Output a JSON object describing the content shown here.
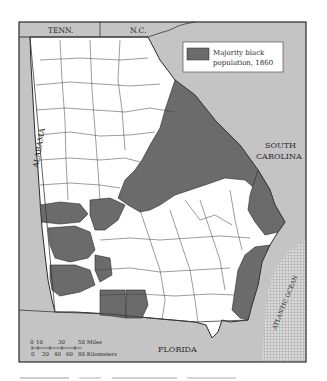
{
  "map": {
    "title_states": {
      "north_left": "TENN.",
      "north_right": "N.C.",
      "east": [
        "SOUTH",
        "CAROLINA"
      ],
      "west": "ALABAMA",
      "south": "FLORIDA",
      "ocean": "ATLANTIC OCEAN"
    },
    "legend": {
      "swatch_color": "#6b6b6b",
      "label_line1": "Majority black",
      "label_line2": "population, 1860"
    },
    "scale_bar": {
      "miles_ticks": [
        "0",
        "10",
        "30",
        "50 Miles"
      ],
      "km_ticks": [
        "0",
        "20",
        "40",
        "60",
        "80 Kilometers"
      ]
    },
    "colors": {
      "shaded_county": "#6b6b6b",
      "unshaded_county": "#ffffff",
      "neighbor_state": "#c4c4c4",
      "county_border": "#3a3a3a",
      "frame_border": "#3a3a3a"
    }
  }
}
